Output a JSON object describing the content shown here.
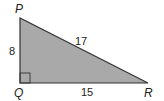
{
  "figure": {
    "type": "right-triangle",
    "fill_color": "#a9a9a9",
    "stroke_color": "#333333",
    "vertices": {
      "P": {
        "label": "P"
      },
      "Q": {
        "label": "Q",
        "right_angle": true
      },
      "R": {
        "label": "R"
      }
    },
    "sides": {
      "PQ": {
        "label": "8"
      },
      "PR": {
        "label": "17"
      },
      "QR": {
        "label": "15"
      }
    }
  }
}
